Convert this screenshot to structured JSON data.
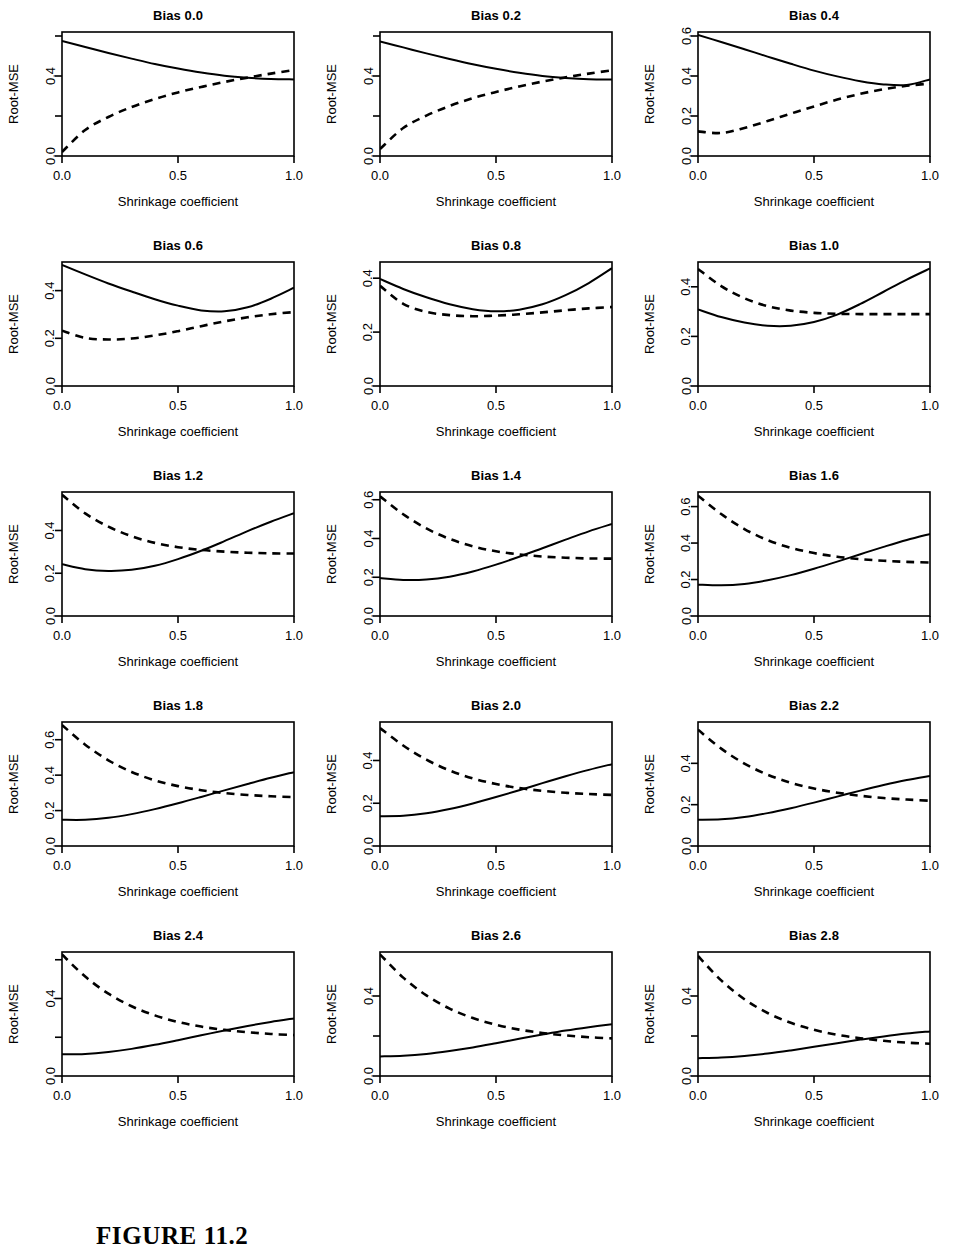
{
  "figure": {
    "caption": "FIGURE 11.2",
    "xlabel": "Shrinkage coefficient",
    "ylabel": "Root-MSE",
    "x_tick_labels": [
      "0.0",
      "0.5",
      "1.0"
    ],
    "x_ticks": [
      0.0,
      0.5,
      1.0
    ],
    "colors": {
      "ink": "#000000",
      "background": "#ffffff"
    },
    "series_styles": {
      "solid": "solid",
      "dashed": "dashed"
    }
  },
  "chart_data": [
    {
      "type": "line",
      "title": "Bias 0.0",
      "xlabel": "Shrinkage coefficient",
      "ylabel": "Root-MSE",
      "xlim": [
        0.0,
        1.0
      ],
      "ylim": [
        0.0,
        0.62
      ],
      "yticks": [
        0.0,
        0.2,
        0.4,
        0.6
      ],
      "ytick_labels": [
        "0.0",
        "",
        "0.4",
        ""
      ],
      "x": [
        0.0,
        0.1,
        0.2,
        0.3,
        0.4,
        0.5,
        0.6,
        0.7,
        0.8,
        0.9,
        1.0
      ],
      "series": [
        {
          "name": "solid",
          "style": "solid",
          "values": [
            0.575,
            0.545,
            0.515,
            0.487,
            0.46,
            0.437,
            0.417,
            0.401,
            0.391,
            0.385,
            0.383
          ]
        },
        {
          "name": "dashed",
          "style": "dashed",
          "values": [
            0.02,
            0.13,
            0.195,
            0.245,
            0.285,
            0.318,
            0.345,
            0.37,
            0.392,
            0.412,
            0.43
          ]
        }
      ]
    },
    {
      "type": "line",
      "title": "Bias 0.2",
      "xlabel": "Shrinkage coefficient",
      "ylabel": "Root-MSE",
      "xlim": [
        0.0,
        1.0
      ],
      "ylim": [
        0.0,
        0.62
      ],
      "yticks": [
        0.0,
        0.2,
        0.4,
        0.6
      ],
      "ytick_labels": [
        "0.0",
        "",
        "0.4",
        ""
      ],
      "x": [
        0.0,
        0.1,
        0.2,
        0.3,
        0.4,
        0.5,
        0.6,
        0.7,
        0.8,
        0.9,
        1.0
      ],
      "series": [
        {
          "name": "solid",
          "style": "solid",
          "values": [
            0.573,
            0.543,
            0.513,
            0.485,
            0.459,
            0.436,
            0.416,
            0.4,
            0.39,
            0.384,
            0.383
          ]
        },
        {
          "name": "dashed",
          "style": "dashed",
          "values": [
            0.035,
            0.14,
            0.202,
            0.25,
            0.289,
            0.32,
            0.348,
            0.372,
            0.393,
            0.412,
            0.428
          ]
        }
      ]
    },
    {
      "type": "line",
      "title": "Bias 0.4",
      "xlabel": "Shrinkage coefficient",
      "ylabel": "Root-MSE",
      "xlim": [
        0.0,
        1.0
      ],
      "ylim": [
        0.0,
        0.62
      ],
      "yticks": [
        0.0,
        0.2,
        0.4,
        0.6
      ],
      "ytick_labels": [
        "0.0",
        "0.2",
        "0.4",
        "0.6"
      ],
      "x": [
        0.0,
        0.1,
        0.2,
        0.3,
        0.4,
        0.5,
        0.6,
        0.7,
        0.8,
        0.9,
        1.0
      ],
      "series": [
        {
          "name": "solid",
          "style": "solid",
          "values": [
            0.605,
            0.57,
            0.534,
            0.497,
            0.461,
            0.427,
            0.398,
            0.374,
            0.358,
            0.355,
            0.383
          ]
        },
        {
          "name": "dashed",
          "style": "dashed",
          "values": [
            0.123,
            0.115,
            0.14,
            0.175,
            0.212,
            0.248,
            0.282,
            0.311,
            0.334,
            0.351,
            0.362
          ]
        }
      ]
    },
    {
      "type": "line",
      "title": "Bias 0.6",
      "xlabel": "Shrinkage coefficient",
      "ylabel": "Root-MSE",
      "xlim": [
        0.0,
        1.0
      ],
      "ylim": [
        0.0,
        0.52
      ],
      "yticks": [
        0.0,
        0.2,
        0.4
      ],
      "ytick_labels": [
        "0.0",
        "0.2",
        "0.4"
      ],
      "x": [
        0.0,
        0.1,
        0.2,
        0.3,
        0.4,
        0.5,
        0.6,
        0.7,
        0.8,
        0.9,
        1.0
      ],
      "series": [
        {
          "name": "solid",
          "style": "solid",
          "values": [
            0.508,
            0.468,
            0.43,
            0.396,
            0.364,
            0.337,
            0.317,
            0.313,
            0.33,
            0.366,
            0.412
          ]
        },
        {
          "name": "dashed",
          "style": "dashed",
          "values": [
            0.232,
            0.202,
            0.195,
            0.199,
            0.212,
            0.23,
            0.251,
            0.271,
            0.288,
            0.301,
            0.31
          ]
        }
      ]
    },
    {
      "type": "line",
      "title": "Bias 0.8",
      "xlabel": "Shrinkage coefficient",
      "ylabel": "Root-MSE",
      "xlim": [
        0.0,
        1.0
      ],
      "ylim": [
        0.0,
        0.46
      ],
      "yticks": [
        0.0,
        0.2,
        0.4
      ],
      "ytick_labels": [
        "0.0",
        "0.2",
        "0.4"
      ],
      "x": [
        0.0,
        0.1,
        0.2,
        0.3,
        0.4,
        0.5,
        0.6,
        0.7,
        0.8,
        0.9,
        1.0
      ],
      "series": [
        {
          "name": "solid",
          "style": "solid",
          "values": [
            0.397,
            0.36,
            0.329,
            0.303,
            0.285,
            0.277,
            0.283,
            0.303,
            0.337,
            0.382,
            0.437
          ]
        },
        {
          "name": "dashed",
          "style": "dashed",
          "values": [
            0.372,
            0.305,
            0.275,
            0.263,
            0.259,
            0.261,
            0.266,
            0.273,
            0.281,
            0.288,
            0.293
          ]
        }
      ]
    },
    {
      "type": "line",
      "title": "Bias 1.0",
      "xlabel": "Shrinkage coefficient",
      "ylabel": "Root-MSE",
      "xlim": [
        0.0,
        1.0
      ],
      "ylim": [
        0.0,
        0.5
      ],
      "yticks": [
        0.0,
        0.2,
        0.4
      ],
      "ytick_labels": [
        "0.0",
        "0.2",
        "0.4"
      ],
      "x": [
        0.0,
        0.1,
        0.2,
        0.3,
        0.4,
        0.5,
        0.6,
        0.7,
        0.8,
        0.9,
        1.0
      ],
      "series": [
        {
          "name": "solid",
          "style": "solid",
          "values": [
            0.309,
            0.278,
            0.256,
            0.243,
            0.243,
            0.258,
            0.288,
            0.331,
            0.38,
            0.429,
            0.474
          ]
        },
        {
          "name": "dashed",
          "style": "dashed",
          "values": [
            0.472,
            0.403,
            0.354,
            0.322,
            0.304,
            0.295,
            0.291,
            0.29,
            0.29,
            0.29,
            0.29
          ]
        }
      ]
    },
    {
      "type": "line",
      "title": "Bias 1.2",
      "xlabel": "Shrinkage coefficient",
      "ylabel": "Root-MSE",
      "xlim": [
        0.0,
        1.0
      ],
      "ylim": [
        0.0,
        0.58
      ],
      "yticks": [
        0.0,
        0.2,
        0.4
      ],
      "ytick_labels": [
        "0.0",
        "0.2",
        "0.4"
      ],
      "x": [
        0.0,
        0.1,
        0.2,
        0.3,
        0.4,
        0.5,
        0.6,
        0.7,
        0.8,
        0.9,
        1.0
      ],
      "series": [
        {
          "name": "solid",
          "style": "solid",
          "values": [
            0.242,
            0.219,
            0.211,
            0.216,
            0.235,
            0.266,
            0.305,
            0.35,
            0.397,
            0.441,
            0.481
          ]
        },
        {
          "name": "dashed",
          "style": "dashed",
          "values": [
            0.567,
            0.48,
            0.418,
            0.373,
            0.342,
            0.322,
            0.309,
            0.301,
            0.296,
            0.293,
            0.292
          ]
        }
      ]
    },
    {
      "type": "line",
      "title": "Bias 1.4",
      "xlabel": "Shrinkage coefficient",
      "ylabel": "Root-MSE",
      "xlim": [
        0.0,
        1.0
      ],
      "ylim": [
        0.0,
        0.64
      ],
      "yticks": [
        0.0,
        0.2,
        0.4,
        0.6
      ],
      "ytick_labels": [
        "0.0",
        "0.2",
        "0.4",
        "0.6"
      ],
      "x": [
        0.0,
        0.1,
        0.2,
        0.3,
        0.4,
        0.5,
        0.6,
        0.7,
        0.8,
        0.9,
        1.0
      ],
      "series": [
        {
          "name": "solid",
          "style": "solid",
          "values": [
            0.196,
            0.186,
            0.188,
            0.203,
            0.23,
            0.265,
            0.306,
            0.35,
            0.394,
            0.437,
            0.475
          ]
        },
        {
          "name": "dashed",
          "style": "dashed",
          "values": [
            0.618,
            0.525,
            0.452,
            0.398,
            0.36,
            0.334,
            0.318,
            0.307,
            0.301,
            0.297,
            0.296
          ]
        }
      ]
    },
    {
      "type": "line",
      "title": "Bias 1.6",
      "xlabel": "Shrinkage coefficient",
      "ylabel": "Root-MSE",
      "xlim": [
        0.0,
        1.0
      ],
      "ylim": [
        0.0,
        0.68
      ],
      "yticks": [
        0.0,
        0.2,
        0.4,
        0.6
      ],
      "ytick_labels": [
        "0.0",
        "0.2",
        "0.4",
        "0.6"
      ],
      "x": [
        0.0,
        0.1,
        0.2,
        0.3,
        0.4,
        0.5,
        0.6,
        0.7,
        0.8,
        0.9,
        1.0
      ],
      "series": [
        {
          "name": "solid",
          "style": "solid",
          "values": [
            0.172,
            0.168,
            0.176,
            0.196,
            0.224,
            0.259,
            0.298,
            0.339,
            0.379,
            0.417,
            0.45
          ]
        },
        {
          "name": "dashed",
          "style": "dashed",
          "values": [
            0.66,
            0.559,
            0.477,
            0.416,
            0.374,
            0.345,
            0.325,
            0.312,
            0.303,
            0.297,
            0.293
          ]
        }
      ]
    },
    {
      "type": "line",
      "title": "Bias 1.8",
      "xlabel": "Shrinkage coefficient",
      "ylabel": "Root-MSE",
      "xlim": [
        0.0,
        1.0
      ],
      "ylim": [
        0.0,
        0.7
      ],
      "yticks": [
        0.0,
        0.2,
        0.4,
        0.6
      ],
      "ytick_labels": [
        "0.0",
        "0.2",
        "0.4",
        "0.6"
      ],
      "x": [
        0.0,
        0.1,
        0.2,
        0.3,
        0.4,
        0.5,
        0.6,
        0.7,
        0.8,
        0.9,
        1.0
      ],
      "series": [
        {
          "name": "solid",
          "style": "solid",
          "values": [
            0.148,
            0.148,
            0.159,
            0.18,
            0.208,
            0.241,
            0.277,
            0.314,
            0.35,
            0.385,
            0.417
          ]
        },
        {
          "name": "dashed",
          "style": "dashed",
          "values": [
            0.683,
            0.572,
            0.484,
            0.418,
            0.371,
            0.338,
            0.315,
            0.299,
            0.288,
            0.281,
            0.276
          ]
        }
      ]
    },
    {
      "type": "line",
      "title": "Bias 2.0",
      "xlabel": "Shrinkage coefficient",
      "ylabel": "Root-MSE",
      "xlim": [
        0.0,
        1.0
      ],
      "ylim": [
        0.0,
        0.58
      ],
      "yticks": [
        0.0,
        0.2,
        0.4
      ],
      "ytick_labels": [
        "0.0",
        "0.2",
        "0.4"
      ],
      "x": [
        0.0,
        0.1,
        0.2,
        0.3,
        0.4,
        0.5,
        0.6,
        0.7,
        0.8,
        0.9,
        1.0
      ],
      "series": [
        {
          "name": "solid",
          "style": "solid",
          "values": [
            0.139,
            0.141,
            0.153,
            0.173,
            0.199,
            0.229,
            0.261,
            0.294,
            0.326,
            0.356,
            0.383
          ]
        },
        {
          "name": "dashed",
          "style": "dashed",
          "values": [
            0.552,
            0.47,
            0.404,
            0.353,
            0.316,
            0.29,
            0.271,
            0.258,
            0.249,
            0.243,
            0.239
          ]
        }
      ]
    },
    {
      "type": "line",
      "title": "Bias 2.2",
      "xlabel": "Shrinkage coefficient",
      "ylabel": "Root-MSE",
      "xlim": [
        0.0,
        1.0
      ],
      "ylim": [
        0.0,
        0.6
      ],
      "yticks": [
        0.0,
        0.2,
        0.4
      ],
      "ytick_labels": [
        "0.0",
        "0.2",
        "0.4"
      ],
      "x": [
        0.0,
        0.1,
        0.2,
        0.3,
        0.4,
        0.5,
        0.6,
        0.7,
        0.8,
        0.9,
        1.0
      ],
      "series": [
        {
          "name": "solid",
          "style": "solid",
          "values": [
            0.127,
            0.129,
            0.14,
            0.159,
            0.183,
            0.21,
            0.239,
            0.268,
            0.295,
            0.319,
            0.339
          ]
        },
        {
          "name": "dashed",
          "style": "dashed",
          "values": [
            0.563,
            0.471,
            0.399,
            0.345,
            0.306,
            0.278,
            0.258,
            0.243,
            0.232,
            0.225,
            0.219
          ]
        }
      ]
    },
    {
      "type": "line",
      "title": "Bias 2.4",
      "xlabel": "Shrinkage coefficient",
      "ylabel": "Root-MSE",
      "xlim": [
        0.0,
        1.0
      ],
      "ylim": [
        0.0,
        0.64
      ],
      "yticks": [
        0.0,
        0.2,
        0.4,
        0.6
      ],
      "ytick_labels": [
        "0.0",
        "",
        "0.4",
        ""
      ],
      "x": [
        0.0,
        0.1,
        0.2,
        0.3,
        0.4,
        0.5,
        0.6,
        0.7,
        0.8,
        0.9,
        1.0
      ],
      "series": [
        {
          "name": "solid",
          "style": "solid",
          "values": [
            0.112,
            0.114,
            0.124,
            0.14,
            0.161,
            0.185,
            0.21,
            0.235,
            0.258,
            0.279,
            0.297
          ]
        },
        {
          "name": "dashed",
          "style": "dashed",
          "values": [
            0.627,
            0.513,
            0.425,
            0.36,
            0.313,
            0.279,
            0.255,
            0.238,
            0.226,
            0.217,
            0.211
          ]
        }
      ]
    },
    {
      "type": "line",
      "title": "Bias 2.6",
      "xlabel": "Shrinkage coefficient",
      "ylabel": "Root-MSE",
      "xlim": [
        0.0,
        1.0
      ],
      "ylim": [
        0.0,
        0.62
      ],
      "yticks": [
        0.0,
        0.2,
        0.4
      ],
      "ytick_labels": [
        "0.0",
        "",
        "0.4"
      ],
      "x": [
        0.0,
        0.1,
        0.2,
        0.3,
        0.4,
        0.5,
        0.6,
        0.7,
        0.8,
        0.9,
        1.0
      ],
      "series": [
        {
          "name": "solid",
          "style": "solid",
          "values": [
            0.098,
            0.101,
            0.11,
            0.125,
            0.143,
            0.164,
            0.186,
            0.207,
            0.227,
            0.244,
            0.259
          ]
        },
        {
          "name": "dashed",
          "style": "dashed",
          "values": [
            0.608,
            0.492,
            0.403,
            0.337,
            0.29,
            0.256,
            0.232,
            0.215,
            0.203,
            0.194,
            0.188
          ]
        }
      ]
    },
    {
      "type": "line",
      "title": "Bias 2.8",
      "xlabel": "Shrinkage coefficient",
      "ylabel": "Root-MSE",
      "xlim": [
        0.0,
        1.0
      ],
      "ylim": [
        0.0,
        0.62
      ],
      "yticks": [
        0.0,
        0.2,
        0.4
      ],
      "ytick_labels": [
        "0.0",
        "",
        "0.4"
      ],
      "x": [
        0.0,
        0.1,
        0.2,
        0.3,
        0.4,
        0.5,
        0.6,
        0.7,
        0.8,
        0.9,
        1.0
      ],
      "series": [
        {
          "name": "solid",
          "style": "solid",
          "values": [
            0.089,
            0.092,
            0.1,
            0.112,
            0.128,
            0.146,
            0.164,
            0.182,
            0.198,
            0.212,
            0.223
          ]
        },
        {
          "name": "dashed",
          "style": "dashed",
          "values": [
            0.6,
            0.478,
            0.384,
            0.315,
            0.266,
            0.231,
            0.206,
            0.189,
            0.176,
            0.167,
            0.161
          ]
        }
      ]
    }
  ]
}
